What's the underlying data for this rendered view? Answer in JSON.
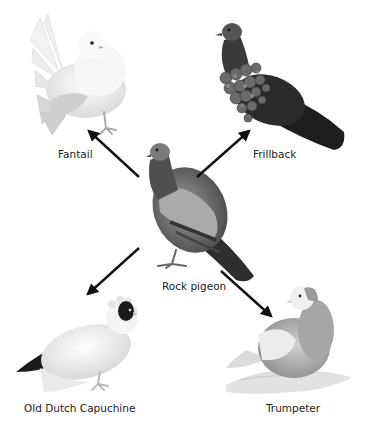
{
  "diagram": {
    "type": "breed-derivation",
    "center": {
      "id": "rock-pigeon",
      "label": "Rock pigeon"
    },
    "breeds": [
      {
        "id": "fantail",
        "label": "Fantail",
        "direction": "upper-left"
      },
      {
        "id": "frillback",
        "label": "Frillback",
        "direction": "upper-right"
      },
      {
        "id": "old-dutch-capuchine",
        "label": "Old Dutch Capuchine",
        "direction": "lower-left"
      },
      {
        "id": "trumpeter",
        "label": "Trumpeter",
        "direction": "lower-right"
      }
    ],
    "arrows": [
      {
        "from": "rock-pigeon",
        "to": "fantail"
      },
      {
        "from": "rock-pigeon",
        "to": "frillback"
      },
      {
        "from": "rock-pigeon",
        "to": "old-dutch-capuchine"
      },
      {
        "from": "rock-pigeon",
        "to": "trumpeter"
      }
    ],
    "colors": {
      "arrow": "#111111",
      "label": "#222222",
      "background": "#ffffff"
    }
  }
}
